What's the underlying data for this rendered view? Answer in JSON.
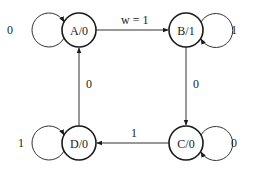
{
  "diagram": {
    "type": "finite-state-machine",
    "states": [
      {
        "id": "A",
        "label": "A/0",
        "cx": 79,
        "cy": 30
      },
      {
        "id": "B",
        "label": "B/1",
        "cx": 186,
        "cy": 30
      },
      {
        "id": "C",
        "label": "C/0",
        "cx": 186,
        "cy": 143
      },
      {
        "id": "D",
        "label": "D/0",
        "cx": 79,
        "cy": 143
      }
    ],
    "transitions": [
      {
        "from": "A",
        "to": "A",
        "label": "0"
      },
      {
        "from": "A",
        "to": "B",
        "label": "w = 1"
      },
      {
        "from": "B",
        "to": "B",
        "label": "1"
      },
      {
        "from": "B",
        "to": "C",
        "label": "0"
      },
      {
        "from": "C",
        "to": "C",
        "label": "0"
      },
      {
        "from": "C",
        "to": "D",
        "label": "1"
      },
      {
        "from": "D",
        "to": "D",
        "label": "1"
      },
      {
        "from": "D",
        "to": "A",
        "label": "0"
      }
    ]
  }
}
